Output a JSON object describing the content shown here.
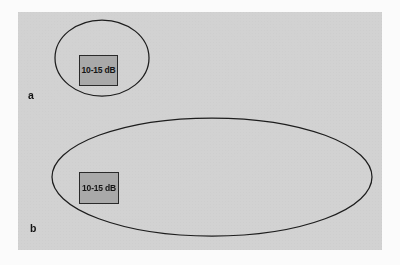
{
  "figure": {
    "background_color": "#fbfbfb",
    "panel_color": "#d2d2d2",
    "line_color": "#1d1d1d",
    "box_fill_color": "#a9a9a9",
    "box_border_color": "#2a2a2a",
    "text_color": "#151515"
  },
  "panels": [
    {
      "letter": "a",
      "region_shape": "ellipse",
      "region": {
        "cx": 102,
        "cy": 58,
        "rx": 47,
        "ry": 38
      },
      "box": {
        "label": "10-15 dB",
        "x": 79,
        "y": 55,
        "width": 39,
        "height": 31
      }
    },
    {
      "letter": "b",
      "region_shape": "ellipse",
      "region": {
        "cx": 212,
        "cy": 177,
        "rx": 160,
        "ry": 59
      },
      "box": {
        "label": "10-15 dB",
        "x": 79,
        "y": 172,
        "width": 40,
        "height": 32
      }
    }
  ]
}
